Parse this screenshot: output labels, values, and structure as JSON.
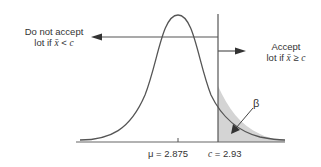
{
  "diagram": {
    "left_label": {
      "line1": "Do not accept",
      "line2_prefix": "lot if ",
      "xbar": "x̄",
      "op": " < ",
      "c": "c"
    },
    "right_label": {
      "line1": "Accept",
      "line2_prefix": "lot if ",
      "xbar": "x̄",
      "op": " ≥ ",
      "c": "c"
    },
    "beta_label": "β",
    "mu_label": "μ = 2.875",
    "c_label_var": "c",
    "c_label_value": " = 2.93",
    "colors": {
      "curve": "#555555",
      "shade": "#d4d4d4",
      "line": "#555555"
    }
  }
}
